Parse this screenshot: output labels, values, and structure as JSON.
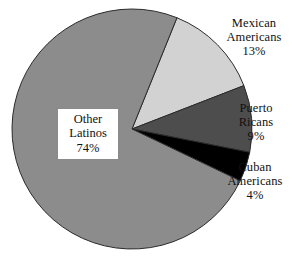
{
  "chart_data": {
    "type": "pie",
    "title": "",
    "subtitle": "",
    "xlabel": "",
    "ylabel": "",
    "legend_position": "callout-labels",
    "grid": false,
    "categories": [
      "Mexican Americans",
      "Puerto Ricans",
      "Cuban Americans",
      "Other Latinos"
    ],
    "values": [
      13,
      9,
      4,
      74
    ],
    "value_suffix": "%",
    "slices": [
      {
        "name": "mexican-americans",
        "label_line1": "Mexican",
        "label_line2": "Americans",
        "value": 13,
        "value_text": "13%",
        "color": "#d2d2d2",
        "start_angle_deg": -68,
        "end_angle_deg": -21.2
      },
      {
        "name": "puerto-ricans",
        "label_line1": "Puerto",
        "label_line2": "Ricans",
        "value": 9,
        "value_text": "9%",
        "color": "#4d4d4d",
        "start_angle_deg": -21.2,
        "end_angle_deg": 11.2
      },
      {
        "name": "cuban-americans",
        "label_line1": "Cuban",
        "label_line2": "Americans",
        "value": 4,
        "value_text": "4%",
        "color": "#000000",
        "start_angle_deg": 11.2,
        "end_angle_deg": 25.6
      },
      {
        "name": "other-latinos",
        "label_line1": "Other",
        "label_line2": "Latinos",
        "value": 74,
        "value_text": "74%",
        "color": "#8c8c8c",
        "start_angle_deg": 25.6,
        "end_angle_deg": 292.0
      }
    ],
    "geometry": {
      "center_x": 132,
      "center_y": 129,
      "radius": 120,
      "outline_color": "#2b2b2b"
    }
  },
  "labels": {
    "mexican": {
      "line1": "Mexican",
      "line2": "Americans",
      "pct": "13%"
    },
    "puerto": {
      "line1": "Puerto",
      "line2": "Ricans",
      "pct": "9%"
    },
    "cuban": {
      "line1": "Cuban",
      "line2": "Americans",
      "pct": "4%"
    },
    "other": {
      "line1": "Other",
      "line2": "Latinos",
      "pct": "74%"
    }
  }
}
